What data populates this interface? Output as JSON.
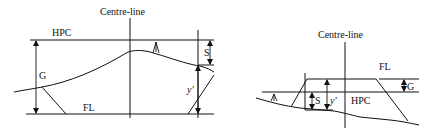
{
  "diagrams": [
    {
      "name": "cutting-section",
      "labels": {
        "centreline": "Centre-line",
        "hpc": "HPC",
        "fl": "FL",
        "g": "G",
        "s": "S",
        "yprime": "y'"
      }
    },
    {
      "name": "embankment-section",
      "labels": {
        "centreline": "Centre-line",
        "hpc": "HPC",
        "fl": "FL",
        "g": "G",
        "s": "S",
        "yprime": "y'"
      }
    }
  ],
  "colors": {
    "line": "#111111",
    "background": "#ffffff"
  }
}
